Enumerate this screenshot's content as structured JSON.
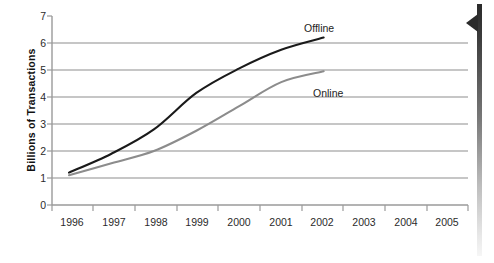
{
  "chart_data": {
    "type": "line",
    "title": "",
    "xlabel": "",
    "ylabel": "Billions of Transactions",
    "x": [
      1996,
      1997,
      1998,
      1999,
      2000,
      2001,
      2002,
      2003,
      2004,
      2005
    ],
    "xtick_labels": [
      "1996",
      "1997",
      "1998",
      "1999",
      "2000",
      "2001",
      "2002",
      "2003",
      "2004",
      "2005"
    ],
    "ytick_labels": [
      "0",
      "1",
      "2",
      "3",
      "4",
      "5",
      "6",
      "7"
    ],
    "ylim": [
      0,
      7
    ],
    "xlim": [
      1995.6,
      2005.4
    ],
    "grid": "horizontal",
    "legend_position": "inline-annotations",
    "series": [
      {
        "name": "Offline",
        "color": "#1a1a1a",
        "x": [
          1996,
          1997,
          1998,
          1999,
          2000,
          2001,
          2002
        ],
        "values": [
          1.2,
          1.9,
          2.8,
          4.15,
          5.05,
          5.75,
          6.2
        ],
        "label_text": "Offline"
      },
      {
        "name": "Online",
        "color": "#8c8c8c",
        "x": [
          1996,
          1997,
          1998,
          1999,
          2000,
          2001,
          2002
        ],
        "values": [
          1.1,
          1.55,
          2.0,
          2.75,
          3.65,
          4.55,
          4.95
        ],
        "label_text": "Online"
      }
    ],
    "annotations": [
      {
        "text": "Offline",
        "x_px": 304,
        "y_px": 22
      },
      {
        "text": "Online",
        "x_px": 313,
        "y_px": 87
      }
    ],
    "axis_color": "#9a9a9a",
    "grid_color": "#8d8d8d",
    "tick_text_color": "#2b2b2b"
  },
  "decorations": {
    "scrollbar_name": "vertical-scrollbar",
    "scroll_arrow_name": "scroll-cursor-arrow"
  }
}
